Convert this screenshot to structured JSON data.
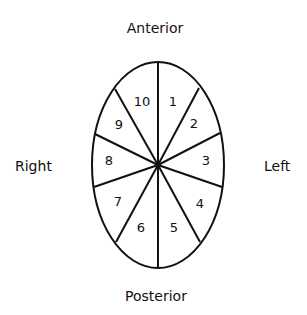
{
  "diagram": {
    "type": "segmented-ellipse",
    "orientation_labels": {
      "top": "Anterior",
      "bottom": "Posterior",
      "left_side": "Right",
      "right_side": "Left"
    },
    "segments": [
      {
        "id": 1,
        "label": "1",
        "x": 173,
        "y": 102
      },
      {
        "id": 2,
        "label": "2",
        "x": 194,
        "y": 124
      },
      {
        "id": 3,
        "label": "3",
        "x": 206,
        "y": 161
      },
      {
        "id": 4,
        "label": "4",
        "x": 200,
        "y": 204
      },
      {
        "id": 5,
        "label": "5",
        "x": 174,
        "y": 228
      },
      {
        "id": 6,
        "label": "6",
        "x": 141,
        "y": 228
      },
      {
        "id": 7,
        "label": "7",
        "x": 118,
        "y": 202
      },
      {
        "id": 8,
        "label": "8",
        "x": 109,
        "y": 161
      },
      {
        "id": 9,
        "label": "9",
        "x": 119,
        "y": 125
      },
      {
        "id": 10,
        "label": "10",
        "x": 142,
        "y": 102
      }
    ],
    "stroke_color": "#111111",
    "background": "#ffffff"
  }
}
